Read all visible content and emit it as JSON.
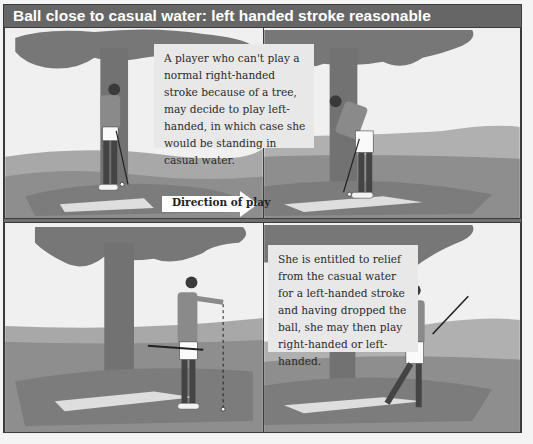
{
  "figure": {
    "title": "Ball close to casual water: left handed stroke reasonable",
    "panels": [
      {
        "id": "top-left",
        "scene": "Right-handed golfer addressing ball beside tree trunk"
      },
      {
        "id": "top-right",
        "scene": "Golfer addressing ball left-handed, standing in casual water"
      },
      {
        "id": "bottom-left",
        "scene": "Golfer dropping ball at arm's length away from casual water"
      },
      {
        "id": "bottom-right",
        "scene": "Golfer completing swing after taking relief"
      }
    ],
    "captions": {
      "top": "A player who can't play a normal right-handed stroke because of a tree, may decide to play left-handed, in which case she would be standing in casual water.",
      "bottom": "She is entitled to relief from the casual water for a left-handed stroke and having dropped the ball, she may then play right-handed or left-handed."
    },
    "direction_label": "Direction of play",
    "colors": {
      "header_bg": "#666666",
      "header_text": "#ffffff",
      "sky": "#efefef",
      "tree": "#7a7a7a",
      "ground": "#8c8c8c",
      "water": "#dcdcdc",
      "caption_bg": "#e8e8e8"
    }
  }
}
